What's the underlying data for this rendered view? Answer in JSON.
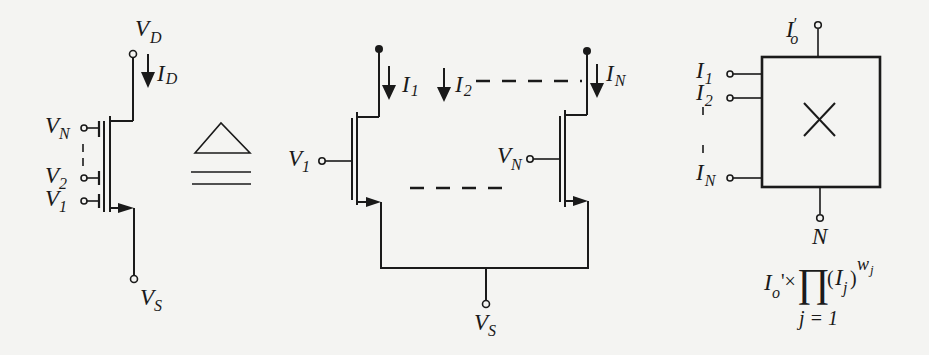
{
  "colors": {
    "ink": "#1a1a1a",
    "paper": "#f4f4f2"
  },
  "left_device": {
    "drain_label": "V",
    "drain_sub": "D",
    "current_label": "I",
    "current_sub": "D",
    "source_label": "V",
    "source_sub": "S",
    "gates": [
      {
        "label": "V",
        "sub": "N"
      },
      {
        "label": "V",
        "sub": "2"
      },
      {
        "label": "V",
        "sub": "1"
      }
    ]
  },
  "equivalence_symbol": "≙",
  "middle_circuit": {
    "currents": [
      {
        "label": "I",
        "sub": "1"
      },
      {
        "label": "I",
        "sub": "2"
      },
      {
        "label": "I",
        "sub": "N"
      }
    ],
    "gate_left": {
      "label": "V",
      "sub": "1"
    },
    "gate_right": {
      "label": "V",
      "sub": "N"
    },
    "source": {
      "label": "V",
      "sub": "S"
    }
  },
  "multiplier_block": {
    "output": {
      "label": "I",
      "prime": "′",
      "sub": "o"
    },
    "inputs": [
      {
        "label": "I",
        "sub": "1"
      },
      {
        "label": "I",
        "sub": "2"
      },
      {
        "label": "I",
        "sub": "N"
      }
    ],
    "symbol": "×",
    "bottom": {
      "label": "N"
    },
    "formula": {
      "lead": "I",
      "lead_sub": "o",
      "prime_times": "'×",
      "product": "∏",
      "paren_open": "(",
      "paren_close": ")",
      "term": "I",
      "term_sub": "j",
      "exponent": "w",
      "exponent_sub": "j",
      "lower_limit": "j = 1"
    }
  }
}
